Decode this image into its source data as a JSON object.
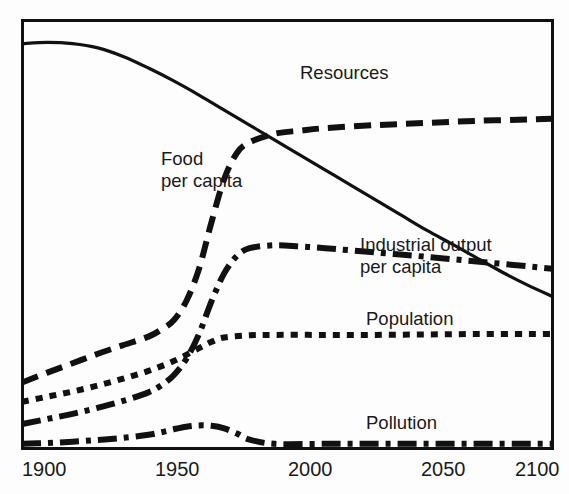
{
  "chart_data": {
    "type": "line",
    "title": "",
    "subtitle": "",
    "xlabel": "",
    "ylabel": "",
    "xlim": [
      1900,
      2110
    ],
    "ylim": [
      0,
      1
    ],
    "grid": false,
    "legend_position": "inline-annotations",
    "x_ticks": [
      "1900",
      "1950",
      "2000",
      "2050",
      "2100"
    ],
    "x_tick_values": [
      1900,
      1950,
      2000,
      2050,
      2100
    ],
    "y_ticks": [],
    "series": [
      {
        "name": "Resources",
        "line_style": "solid",
        "color": "#111111",
        "label_x": 300,
        "label_y": 62,
        "x": [
          1900,
          1910,
          1920,
          1930,
          1940,
          1950,
          1960,
          1970,
          1980,
          1990,
          2000,
          2010,
          2020,
          2030,
          2040,
          2050,
          2060,
          2070,
          2080,
          2090,
          2100,
          2110
        ],
        "values": [
          0.945,
          0.948,
          0.945,
          0.935,
          0.915,
          0.888,
          0.858,
          0.825,
          0.79,
          0.755,
          0.72,
          0.685,
          0.65,
          0.615,
          0.58,
          0.545,
          0.51,
          0.478,
          0.445,
          0.412,
          0.382,
          0.355
        ]
      },
      {
        "name": "Food per capita",
        "line_style": "dashed",
        "color": "#111111",
        "label_lines": [
          "Food",
          "per capita"
        ],
        "label_x": 161,
        "label_y": 148,
        "x": [
          1900,
          1910,
          1920,
          1930,
          1940,
          1950,
          1955,
          1960,
          1965,
          1970,
          1975,
          1980,
          1985,
          1990,
          2000,
          2010,
          2020,
          2040,
          2060,
          2080,
          2100,
          2110
        ],
        "values": [
          0.155,
          0.178,
          0.2,
          0.222,
          0.242,
          0.262,
          0.278,
          0.3,
          0.345,
          0.42,
          0.53,
          0.63,
          0.69,
          0.715,
          0.735,
          0.742,
          0.748,
          0.755,
          0.76,
          0.765,
          0.768,
          0.77
        ]
      },
      {
        "name": "Industrial output per capita",
        "line_style": "dash-dot",
        "color": "#111111",
        "label_lines": [
          "Industrial output",
          "per capita"
        ],
        "label_x": 360,
        "label_y": 234,
        "x": [
          1900,
          1910,
          1920,
          1930,
          1940,
          1950,
          1955,
          1960,
          1965,
          1970,
          1975,
          1980,
          1985,
          1990,
          2000,
          2010,
          2020,
          2040,
          2060,
          2080,
          2100,
          2110
        ],
        "values": [
          0.058,
          0.07,
          0.082,
          0.096,
          0.112,
          0.132,
          0.148,
          0.172,
          0.21,
          0.268,
          0.345,
          0.41,
          0.45,
          0.468,
          0.475,
          0.472,
          0.468,
          0.458,
          0.448,
          0.437,
          0.426,
          0.42
        ]
      },
      {
        "name": "Population",
        "line_style": "dotted",
        "color": "#111111",
        "label_x": 366,
        "label_y": 308,
        "x": [
          1900,
          1910,
          1920,
          1930,
          1940,
          1950,
          1960,
          1970,
          1975,
          1980,
          1990,
          2000,
          2020,
          2040,
          2060,
          2080,
          2100,
          2110
        ],
        "values": [
          0.11,
          0.122,
          0.134,
          0.148,
          0.164,
          0.182,
          0.205,
          0.235,
          0.25,
          0.26,
          0.265,
          0.266,
          0.266,
          0.266,
          0.267,
          0.268,
          0.268,
          0.268
        ]
      },
      {
        "name": "Pollution",
        "line_style": "dash-dot",
        "color": "#111111",
        "label_x": 366,
        "label_y": 412,
        "x": [
          1900,
          1910,
          1920,
          1930,
          1940,
          1950,
          1955,
          1960,
          1965,
          1970,
          1975,
          1980,
          1985,
          1990,
          2000,
          2020,
          2040,
          2060,
          2080,
          2100,
          2110
        ],
        "values": [
          0.012,
          0.014,
          0.017,
          0.021,
          0.026,
          0.033,
          0.039,
          0.046,
          0.052,
          0.055,
          0.054,
          0.048,
          0.036,
          0.022,
          0.012,
          0.012,
          0.012,
          0.012,
          0.012,
          0.012,
          0.012
        ]
      }
    ],
    "annotations": [
      {
        "text": "Resources",
        "note": "solid line label above declining curve"
      },
      {
        "text": "Food per capita",
        "note": "two-line label left of rising dashed curve"
      },
      {
        "text": "Industrial output per capita",
        "note": "two-line label above dash-dot plateau"
      },
      {
        "text": "Population",
        "note": "label above dotted plateau"
      },
      {
        "text": "Pollution",
        "note": "label above flat dash-dot baseline"
      }
    ]
  },
  "axis": {
    "x_tick_labels": [
      {
        "label": "1900",
        "px": 22
      },
      {
        "label": "1950",
        "px": 155
      },
      {
        "label": "2000",
        "px": 288
      },
      {
        "label": "2050",
        "px": 421
      },
      {
        "label": "2100",
        "px": 515
      }
    ]
  },
  "labels": {
    "resources": "Resources",
    "food_line1": "Food",
    "food_line2": "per capita",
    "industrial_line1": "Industrial output",
    "industrial_line2": "per capita",
    "population": "Population",
    "pollution": "Pollution",
    "tick_1900": "1900",
    "tick_1950": "1950",
    "tick_2000": "2000",
    "tick_2050": "2050",
    "tick_2100": "2100"
  },
  "style": {
    "ink": "#111111",
    "background": "#fdfdfd",
    "frame": "#111111"
  }
}
